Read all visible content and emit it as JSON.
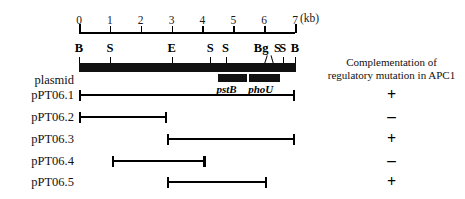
{
  "figure": {
    "scale": {
      "unit_label": "(kb)",
      "ticks": [
        "0",
        "1",
        "2",
        "3",
        "4",
        "5",
        "6",
        "7"
      ],
      "min_kb": 0,
      "max_kb": 7,
      "px_per_kb": 30.86,
      "origin_px": 79
    },
    "restriction_sites": [
      {
        "label": "B",
        "kb": 0.0
      },
      {
        "label": "S",
        "kb": 1.0
      },
      {
        "label": "E",
        "kb": 3.0
      },
      {
        "label": "S",
        "kb": 4.25
      },
      {
        "label": "S",
        "kb": 4.75
      },
      {
        "label": "Bg",
        "kb": 6.0
      },
      {
        "label": "S",
        "kb": 6.3
      },
      {
        "label": "S",
        "kb": 6.6
      },
      {
        "label": "B",
        "kb": 7.0
      }
    ],
    "backbone": {
      "start_kb": 0.0,
      "end_kb": 7.0
    },
    "genes": [
      {
        "name": "pstB",
        "start_kb": 4.5,
        "end_kb": 5.45
      },
      {
        "name": "phoU",
        "start_kb": 5.5,
        "end_kb": 6.5
      }
    ],
    "plasmid_row_label": "plasmid",
    "rows": [
      {
        "label": "pPT06.1",
        "start_kb": 0.0,
        "end_kb": 7.0,
        "result": "+"
      },
      {
        "label": "pPT06.2",
        "start_kb": 0.0,
        "end_kb": 2.85,
        "result": "–"
      },
      {
        "label": "pPT06.3",
        "start_kb": 2.85,
        "end_kb": 7.0,
        "result": "+"
      },
      {
        "label": "pPT06.4",
        "start_kb": 1.07,
        "end_kb": 4.1,
        "result": "–"
      },
      {
        "label": "pPT06.5",
        "start_kb": 2.85,
        "end_kb": 6.1,
        "result": "+"
      }
    ],
    "complementation": {
      "header_line1": "Complementation of",
      "header_line2": "regulatory mutation in APC1"
    }
  }
}
